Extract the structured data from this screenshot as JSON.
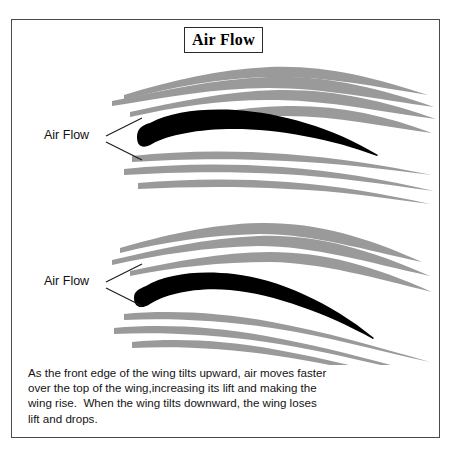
{
  "figure": {
    "title": "Air Flow",
    "background_color": "#ffffff",
    "frame_color": "#4a4a4a",
    "airfoil_color": "#000000",
    "streamline_color": "#9a9a9a",
    "text_color": "#131313"
  },
  "diagrams": [
    {
      "id": "upper-wing-tilted-up",
      "label": "Air Flow",
      "description": "Wing tilted upward with air streamlines passing over and under"
    },
    {
      "id": "lower-wing-tilted-down",
      "label": "Air Flow",
      "description": "Wing tilted downward with air streamlines passing over and under"
    }
  ],
  "callouts": {
    "top_label": "Air Flow",
    "bottom_label": "Air Flow"
  },
  "caption": {
    "lines": [
      "As the front edge of the wing tilts upward, air moves faster",
      "over the top of the wing,increasing its lift and making the",
      "wing rise.  When the wing tilts downward, the wing loses",
      "lift and drops."
    ],
    "line1": "As the front edge of the wing tilts upward, air moves faster",
    "line2": "over the top of the wing,increasing its lift and making the",
    "line3": "wing rise.  When the wing tilts downward, the wing loses",
    "line4": "lift and drops."
  }
}
